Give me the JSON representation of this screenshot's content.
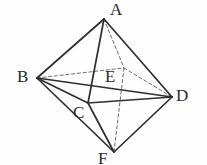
{
  "figure": {
    "name": "octahedron-diagram",
    "type": "geometric-solid",
    "canvas": {
      "width": 207,
      "height": 165
    },
    "background_color": "#fefefe",
    "stroke_color": "#2f2f33",
    "dashed_color": "#6d6d72",
    "label_color": "#2b2b2b",
    "vertices": [
      {
        "id": "A",
        "label": "A",
        "x": 104,
        "y": 19,
        "label_x": 110,
        "label_y": 1,
        "role": "top-apex"
      },
      {
        "id": "B",
        "label": "B",
        "x": 37,
        "y": 78,
        "label_x": 17,
        "label_y": 68,
        "role": "left-vertex"
      },
      {
        "id": "C",
        "label": "C",
        "x": 88,
        "y": 103,
        "label_x": 73,
        "label_y": 104,
        "role": "front-lower-left-vertex"
      },
      {
        "id": "D",
        "label": "D",
        "x": 172,
        "y": 97,
        "label_x": 176,
        "label_y": 87,
        "role": "right-vertex"
      },
      {
        "id": "E",
        "label": "E",
        "x": 124,
        "y": 68,
        "label_x": 105,
        "label_y": 68,
        "role": "hidden-back-vertex"
      },
      {
        "id": "F",
        "label": "F",
        "x": 114,
        "y": 152,
        "label_x": 98,
        "label_y": 150,
        "role": "bottom-apex"
      }
    ],
    "edges_solid": [
      {
        "from": "A",
        "to": "B"
      },
      {
        "from": "A",
        "to": "C"
      },
      {
        "from": "A",
        "to": "D"
      },
      {
        "from": "B",
        "to": "C"
      },
      {
        "from": "B",
        "to": "D"
      },
      {
        "from": "B",
        "to": "F"
      },
      {
        "from": "C",
        "to": "D"
      },
      {
        "from": "C",
        "to": "F"
      },
      {
        "from": "D",
        "to": "F"
      }
    ],
    "edges_dashed": [
      {
        "from": "A",
        "to": "E"
      },
      {
        "from": "B",
        "to": "E"
      },
      {
        "from": "E",
        "to": "D"
      },
      {
        "from": "E",
        "to": "F"
      }
    ]
  }
}
